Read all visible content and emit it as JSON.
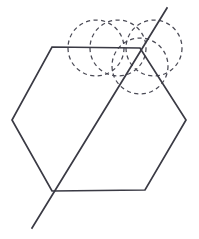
{
  "figure": {
    "title": "Geometric construction: hexagon with transversal line and four dashed circles",
    "canvas": {
      "width": 199,
      "height": 239,
      "background": "#ffffff"
    },
    "colors": {
      "solid_line": "#3a3a44",
      "dashed_line": "#4a4a55",
      "background": "#ffffff"
    },
    "stroke_widths": {
      "solid": 1.7,
      "dashed": 1.25
    },
    "dash_pattern": "4.2 3.4"
  },
  "shapes": {
    "hexagon": {
      "name": "hexagon",
      "closed": true,
      "points": [
        {
          "label": "top-left",
          "x": 52,
          "y": 47
        },
        {
          "label": "top-right",
          "x": 140,
          "y": 48
        },
        {
          "label": "right",
          "x": 186,
          "y": 120
        },
        {
          "label": "bottom-right",
          "x": 145,
          "y": 190
        },
        {
          "label": "bottom-left",
          "x": 52,
          "y": 191
        },
        {
          "label": "left",
          "x": 12,
          "y": 120
        }
      ],
      "points_attr": "52,47 140,48 186,120 145,190 52,191 12,120"
    },
    "transversal": {
      "name": "transversal-line",
      "x1": 167,
      "y1": 8,
      "x2": 32,
      "y2": 228
    },
    "circles": [
      {
        "label": "circle-left",
        "cx": 96,
        "cy": 48,
        "r": 28
      },
      {
        "label": "circle-middle",
        "cx": 118,
        "cy": 48,
        "r": 28
      },
      {
        "label": "circle-right",
        "cx": 154,
        "cy": 48,
        "r": 28
      },
      {
        "label": "circle-lower",
        "cx": 140,
        "cy": 66,
        "r": 28
      }
    ]
  }
}
